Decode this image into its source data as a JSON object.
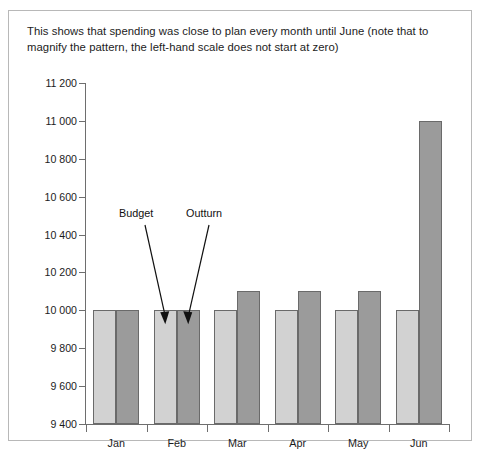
{
  "caption": "This shows that spending was close to plan every month until June (note that to magnify the pattern, the left-hand scale does not start at zero)",
  "annotations": {
    "budget_label": "Budget",
    "outturn_label": "Outturn"
  },
  "colors": {
    "budget_fill": "#d2d2d2",
    "outturn_fill": "#9b9b9b",
    "bar_stroke": "#6a6a6a",
    "axis": "#6e6e6e",
    "frame": "#b8b8b8",
    "text": "#1c1c1c"
  },
  "chart_data": {
    "type": "bar",
    "title": "This shows that spending was close to plan every month until June (note that to magnify the pattern, the left-hand scale does not start at zero)",
    "xlabel": "",
    "ylabel": "",
    "categories": [
      "Jan",
      "Feb",
      "Mar",
      "Apr",
      "May",
      "Jun"
    ],
    "series": [
      {
        "name": "Budget",
        "values": [
          10000,
          10000,
          10000,
          10000,
          10000,
          10000
        ]
      },
      {
        "name": "Outturn",
        "values": [
          10000,
          10000,
          10100,
          10100,
          10100,
          11000
        ]
      }
    ],
    "ylim": [
      9400,
      11200
    ],
    "ytick_step": 200,
    "ytick_labels": [
      "11 200",
      "11 000",
      "10 800",
      "10 600",
      "10 400",
      "10 200",
      "10 000",
      "9 800",
      "9 600",
      "9 400"
    ],
    "ytick_values": [
      11200,
      11000,
      10800,
      10600,
      10400,
      10200,
      10000,
      9800,
      9600,
      9400
    ],
    "grid": false,
    "legend": "none",
    "annotations": [
      {
        "text": "Budget",
        "points_to": "Feb budget bar top"
      },
      {
        "text": "Outturn",
        "points_to": "Feb outturn bar top"
      }
    ]
  }
}
